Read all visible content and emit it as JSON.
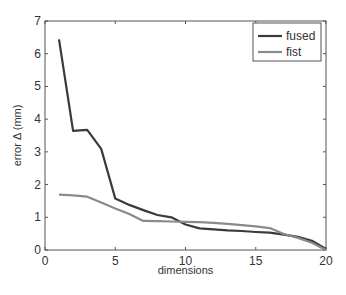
{
  "chart_data": {
    "type": "line",
    "title": "",
    "xlabel": "dimensions",
    "ylabel": "error Δ (mm)",
    "xlim": [
      0,
      20
    ],
    "ylim": [
      0,
      7
    ],
    "xticks": [
      0,
      5,
      10,
      15,
      20
    ],
    "yticks": [
      0,
      1,
      2,
      3,
      4,
      5,
      6,
      7
    ],
    "grid": false,
    "legend_position": "upper right",
    "x": [
      1,
      2,
      3,
      4,
      5,
      6,
      7,
      8,
      9,
      10,
      11,
      12,
      13,
      14,
      15,
      16,
      17,
      18,
      19,
      20
    ],
    "series": [
      {
        "name": "fused",
        "color": "#3a3a3a",
        "values": [
          6.44,
          3.64,
          3.67,
          3.09,
          1.57,
          1.38,
          1.22,
          1.07,
          1.0,
          0.78,
          0.66,
          0.63,
          0.6,
          0.58,
          0.55,
          0.53,
          0.47,
          0.4,
          0.28,
          0.03
        ]
      },
      {
        "name": "fist",
        "color": "#8a8a8a",
        "values": [
          1.69,
          1.67,
          1.63,
          1.45,
          1.27,
          1.1,
          0.89,
          0.88,
          0.87,
          0.86,
          0.85,
          0.83,
          0.8,
          0.76,
          0.72,
          0.67,
          0.49,
          0.37,
          0.22,
          0.0
        ]
      }
    ]
  }
}
